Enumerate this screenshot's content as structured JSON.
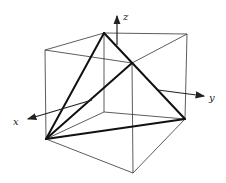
{
  "figure": {
    "axes": {
      "x_label": "x",
      "y_label": "y",
      "z_label": "z"
    },
    "colors": {
      "line": "#222222",
      "background": "#ffffff"
    }
  }
}
